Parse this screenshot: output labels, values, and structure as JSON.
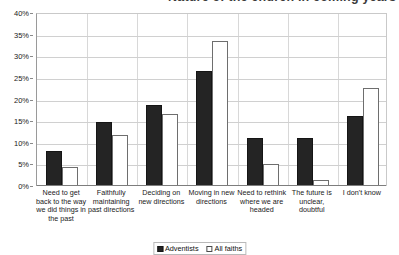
{
  "title": {
    "text": "Nature of the church in coming years"
  },
  "legend": {
    "items": [
      {
        "label": "Adventists",
        "swatch": "filled-black-square-icon",
        "color": "#242424"
      },
      {
        "label": "All faiths",
        "swatch": "outlined-white-square-icon",
        "color": "#ffffff"
      }
    ]
  },
  "axis": {
    "y_ticks": [
      "0%",
      "5%",
      "10%",
      "15%",
      "20%",
      "25%",
      "30%",
      "35%",
      "40%"
    ]
  },
  "chart_data": {
    "type": "bar",
    "title": "Nature of the church in coming years",
    "xlabel": "",
    "ylabel": "",
    "ylim": [
      0,
      40
    ],
    "ytick_values": [
      0,
      5,
      10,
      15,
      20,
      25,
      30,
      35,
      40
    ],
    "ytick_labels": [
      "0%",
      "5%",
      "10%",
      "15%",
      "20%",
      "25%",
      "30%",
      "35%",
      "40%"
    ],
    "grid": true,
    "legend_position": "bottom-center",
    "units": "percent",
    "categories": [
      "Need to get back to the way we did things in the past",
      "Faithfully maintaining past directions",
      "Deciding on new directions",
      "Moving in new directions",
      "Need to rethink where we are headed",
      "The future is unclear, doubtful",
      "I don't know"
    ],
    "series": [
      {
        "name": "Adventists",
        "color": "#242424",
        "values": [
          8.0,
          14.8,
          18.7,
          26.5,
          11.1,
          11.1,
          16.2
        ]
      },
      {
        "name": "All faiths",
        "color": "#ffffff",
        "values": [
          4.5,
          11.8,
          16.6,
          33.5,
          5.1,
          1.5,
          22.6
        ]
      }
    ]
  }
}
